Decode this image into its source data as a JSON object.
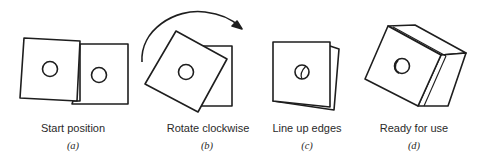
{
  "panels": [
    {
      "caption": "Start position",
      "label": "(a)"
    },
    {
      "caption": "Rotate clockwise",
      "label": "(b)"
    },
    {
      "caption": "Line up edges",
      "label": "(c)"
    },
    {
      "caption": "Ready for use",
      "label": "(d)"
    }
  ],
  "colors": {
    "stroke": "#1e1e1e",
    "background": "#ffffff"
  }
}
